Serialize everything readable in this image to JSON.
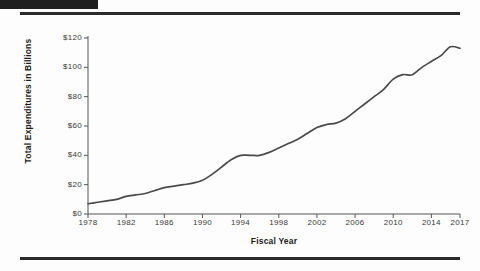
{
  "page": {
    "header_block": "black-bar",
    "rules": [
      "top-rule",
      "bottom-rule"
    ]
  },
  "chart_data": {
    "type": "line",
    "title": "",
    "xlabel": "Fiscal Year",
    "ylabel": "Total Expenditures in Billions",
    "xlim": [
      1978,
      2017
    ],
    "ylim": [
      0,
      120
    ],
    "grid": false,
    "legend": "none",
    "line_color": "#4a4a4a",
    "ytick_labels": [
      "$0",
      "$20",
      "$40",
      "$60",
      "$80",
      "$100",
      "$120"
    ],
    "ytick_values": [
      0,
      20,
      40,
      60,
      80,
      100,
      120
    ],
    "xtick_labels": [
      "1978",
      "1982",
      "1986",
      "1990",
      "1994",
      "1998",
      "2002",
      "2006",
      "2010",
      "2014",
      "2017"
    ],
    "xtick_values": [
      1978,
      1982,
      1986,
      1990,
      1994,
      1998,
      2002,
      2006,
      2010,
      2014,
      2017
    ],
    "x": [
      1978,
      1979,
      1980,
      1981,
      1982,
      1983,
      1984,
      1985,
      1986,
      1987,
      1988,
      1989,
      1990,
      1991,
      1992,
      1993,
      1994,
      1995,
      1996,
      1997,
      1998,
      1999,
      2000,
      2001,
      2002,
      2003,
      2004,
      2005,
      2006,
      2007,
      2008,
      2009,
      2010,
      2011,
      2012,
      2013,
      2014,
      2015,
      2016,
      2017
    ],
    "values": [
      7,
      8,
      9,
      10,
      12,
      13,
      14,
      16,
      18,
      19,
      20,
      21,
      23,
      27,
      32,
      37,
      40,
      40,
      40,
      42,
      45,
      48,
      51,
      55,
      59,
      61,
      62,
      65,
      70,
      75,
      80,
      85,
      92,
      95,
      95,
      100,
      104,
      108,
      114,
      113
    ]
  }
}
